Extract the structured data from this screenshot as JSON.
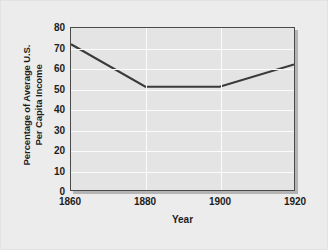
{
  "chart_data": {
    "type": "line",
    "title": "",
    "xlabel": "Year",
    "ylabel_line1": "Percentage of Average U.S.",
    "ylabel_line2": "Per Capita Income",
    "ylabel": "Percentage of Average U.S. Per Capita Income",
    "x": [
      1860,
      1880,
      1900,
      1920
    ],
    "values": [
      72,
      51,
      51,
      62
    ],
    "series": [
      {
        "name": "Percentage of Average U.S. Per Capita Income",
        "values": [
          72,
          51,
          51,
          62
        ]
      }
    ],
    "xticks": [
      "1860",
      "1880",
      "1900",
      "1920"
    ],
    "xtick_values": [
      1860,
      1880,
      1900,
      1920
    ],
    "yticks": [
      "0",
      "10",
      "20",
      "30",
      "40",
      "50",
      "60",
      "70",
      "80"
    ],
    "ytick_values": [
      0,
      10,
      20,
      30,
      40,
      50,
      60,
      70,
      80
    ],
    "xlim": [
      1860,
      1920
    ],
    "ylim": [
      0,
      80
    ],
    "grid": true,
    "grid_axes": "both",
    "legend": false,
    "legend_position": "none",
    "colors": {
      "line": "#3a3a3a",
      "plot_background": "#e4e4e4",
      "figure_background": "#ececec",
      "gridline": "#fbfbfb",
      "axis_frame": "#4a4a4a",
      "text": "#1d1d1d",
      "shadow": "#b4b4b4"
    }
  }
}
